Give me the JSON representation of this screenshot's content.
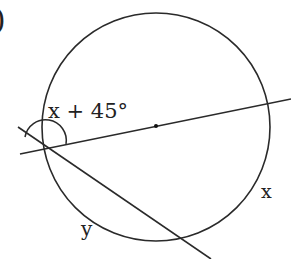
{
  "problem_number_fragment": ")",
  "labels": {
    "angle": "x + 45°",
    "arc_x": "x",
    "arc_y": "y"
  },
  "geometry": {
    "circle": {
      "cx": 156,
      "cy": 127,
      "r": 114
    },
    "center_dot": {
      "x": 156,
      "y": 126
    },
    "vertex": {
      "x": 43,
      "y": 149
    },
    "secant_through_center": {
      "x1": 20,
      "y1": 154,
      "x2": 291,
      "y2": 99
    },
    "second_line": {
      "x1": 18,
      "y1": 127,
      "x2": 211,
      "y2": 259
    }
  },
  "colors": {
    "stroke": "#2a2a2a",
    "background": "#ffffff"
  }
}
